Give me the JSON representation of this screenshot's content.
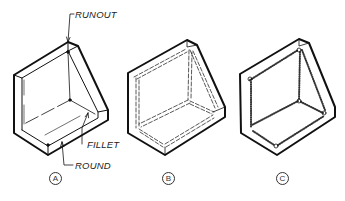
{
  "figure": {
    "views": [
      {
        "id": "A",
        "label": "A",
        "style": "solid-lines"
      },
      {
        "id": "B",
        "label": "B",
        "style": "double-dashed-hidden"
      },
      {
        "id": "C",
        "label": "C",
        "style": "stippled"
      }
    ],
    "callouts": {
      "runout": "RUNOUT",
      "fillet": "FILLET",
      "round": "ROUND"
    }
  }
}
